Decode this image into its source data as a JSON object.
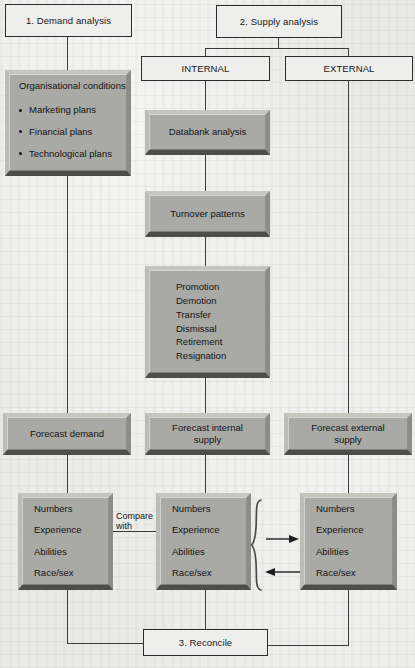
{
  "diagram": {
    "colors": {
      "background": "#e9e9e6",
      "box_face": "#a9a9a5",
      "box_highlight": "#d6d6d1",
      "box_shadow": "#4d4d4b",
      "line": "#3a3a3c",
      "text": "#141416"
    },
    "nodes": {
      "demand_analysis": "1.  Demand analysis",
      "supply_analysis": "2.  Supply analysis",
      "internal": "INTERNAL",
      "external": "EXTERNAL",
      "databank_analysis": "Databank analysis",
      "turnover_patterns": "Turnover patterns",
      "forecast_demand": "Forecast demand",
      "forecast_internal_supply_line1": "Forecast internal",
      "forecast_internal_supply_line2": "supply",
      "forecast_external_supply_line1": "Forecast external",
      "forecast_external_supply_line2": "supply",
      "reconcile": "3.  Reconcile"
    },
    "organisational_conditions": {
      "title": "Organisational conditions",
      "items": [
        "Marketing plans",
        "Financial plans",
        "Technological plans"
      ]
    },
    "turnover_events": [
      "Promotion",
      "Demotion",
      "Transfer",
      "Dismissal",
      "Retirement",
      "Resignation"
    ],
    "attributes": [
      "Numbers",
      "Experience",
      "Abilities",
      "Race/sex"
    ],
    "connector_labels": {
      "compare_line1": "Compare",
      "compare_line2": "with"
    },
    "arrows": {
      "to_external": "arrow-right-icon",
      "from_external": "arrow-left-icon",
      "brace": "curly-brace-icon"
    }
  }
}
